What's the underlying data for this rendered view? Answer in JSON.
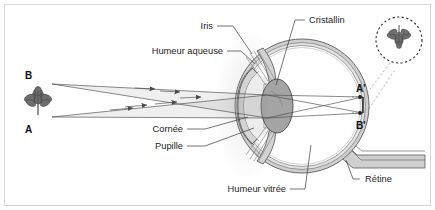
{
  "diagram": {
    "language": "fr",
    "background_color": "#ffffff",
    "border_color": "#d8d8d8",
    "line_color": "#3a3a3a",
    "tissue_fill": "#c9c9c9",
    "lens_fill": "#9e9e9e"
  },
  "labels": {
    "iris": "Iris",
    "humeur_aqueuse": "Humeur aqueuse",
    "cristallin": "Cristallin",
    "cornee": "Cornée",
    "pupille": "Pupille",
    "humeur_vitree": "Humeur vitrée",
    "retine": "Rétine"
  },
  "object_points": {
    "b_label": "B",
    "a_label": "A"
  },
  "image_points": {
    "a_prime_label": "A'",
    "b_prime_label": "B'"
  },
  "inset": {
    "name": "inverted-image-inset",
    "description": "image renversee de l'objet sur la retine",
    "border_style": "dashed"
  },
  "optics": {
    "object_name": "fleur",
    "ray_count": 4,
    "ray_direction": "gauche vers droite",
    "arrowheads": "true",
    "image_orientation": "renversee"
  }
}
